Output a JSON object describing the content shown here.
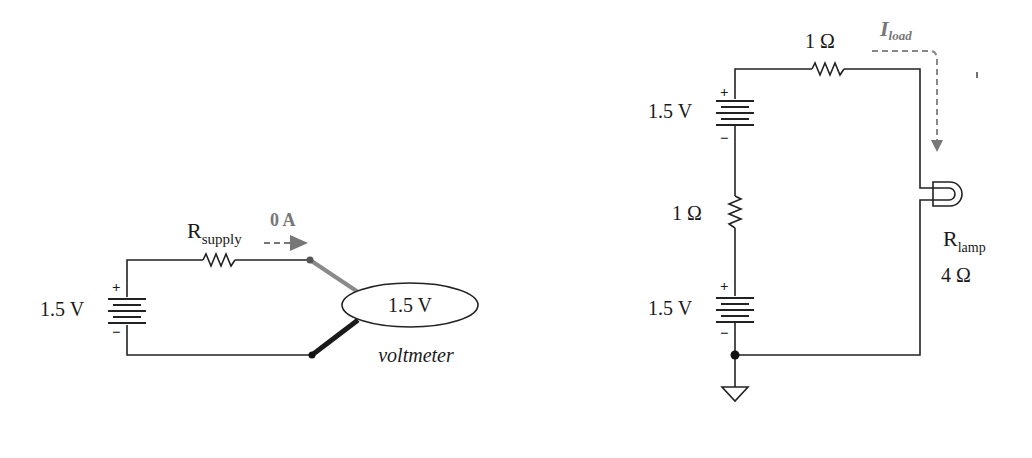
{
  "left_circuit": {
    "battery_label": "1.5 V",
    "battery_plus": "+",
    "battery_minus": "−",
    "resistor_label_main": "R",
    "resistor_label_sub": "supply",
    "current_label": "0 A",
    "meter_reading": "1.5 V",
    "meter_caption": "voltmeter"
  },
  "right_circuit": {
    "top_resistor_label": "1 Ω",
    "current_label_main": "I",
    "current_label_sub": "load",
    "top_battery_label": "1.5 V",
    "top_battery_plus": "+",
    "top_battery_minus": "−",
    "mid_resistor_label": "1 Ω",
    "bottom_battery_label": "1.5 V",
    "bottom_battery_plus": "+",
    "bottom_battery_minus": "−",
    "lamp_label_main": "R",
    "lamp_label_sub": "lamp",
    "lamp_value": "4 Ω"
  },
  "colors": {
    "wire": "#222222",
    "annotation": "#777777",
    "probe_red": "#8a8a8a",
    "probe_black": "#1a1a1a"
  }
}
